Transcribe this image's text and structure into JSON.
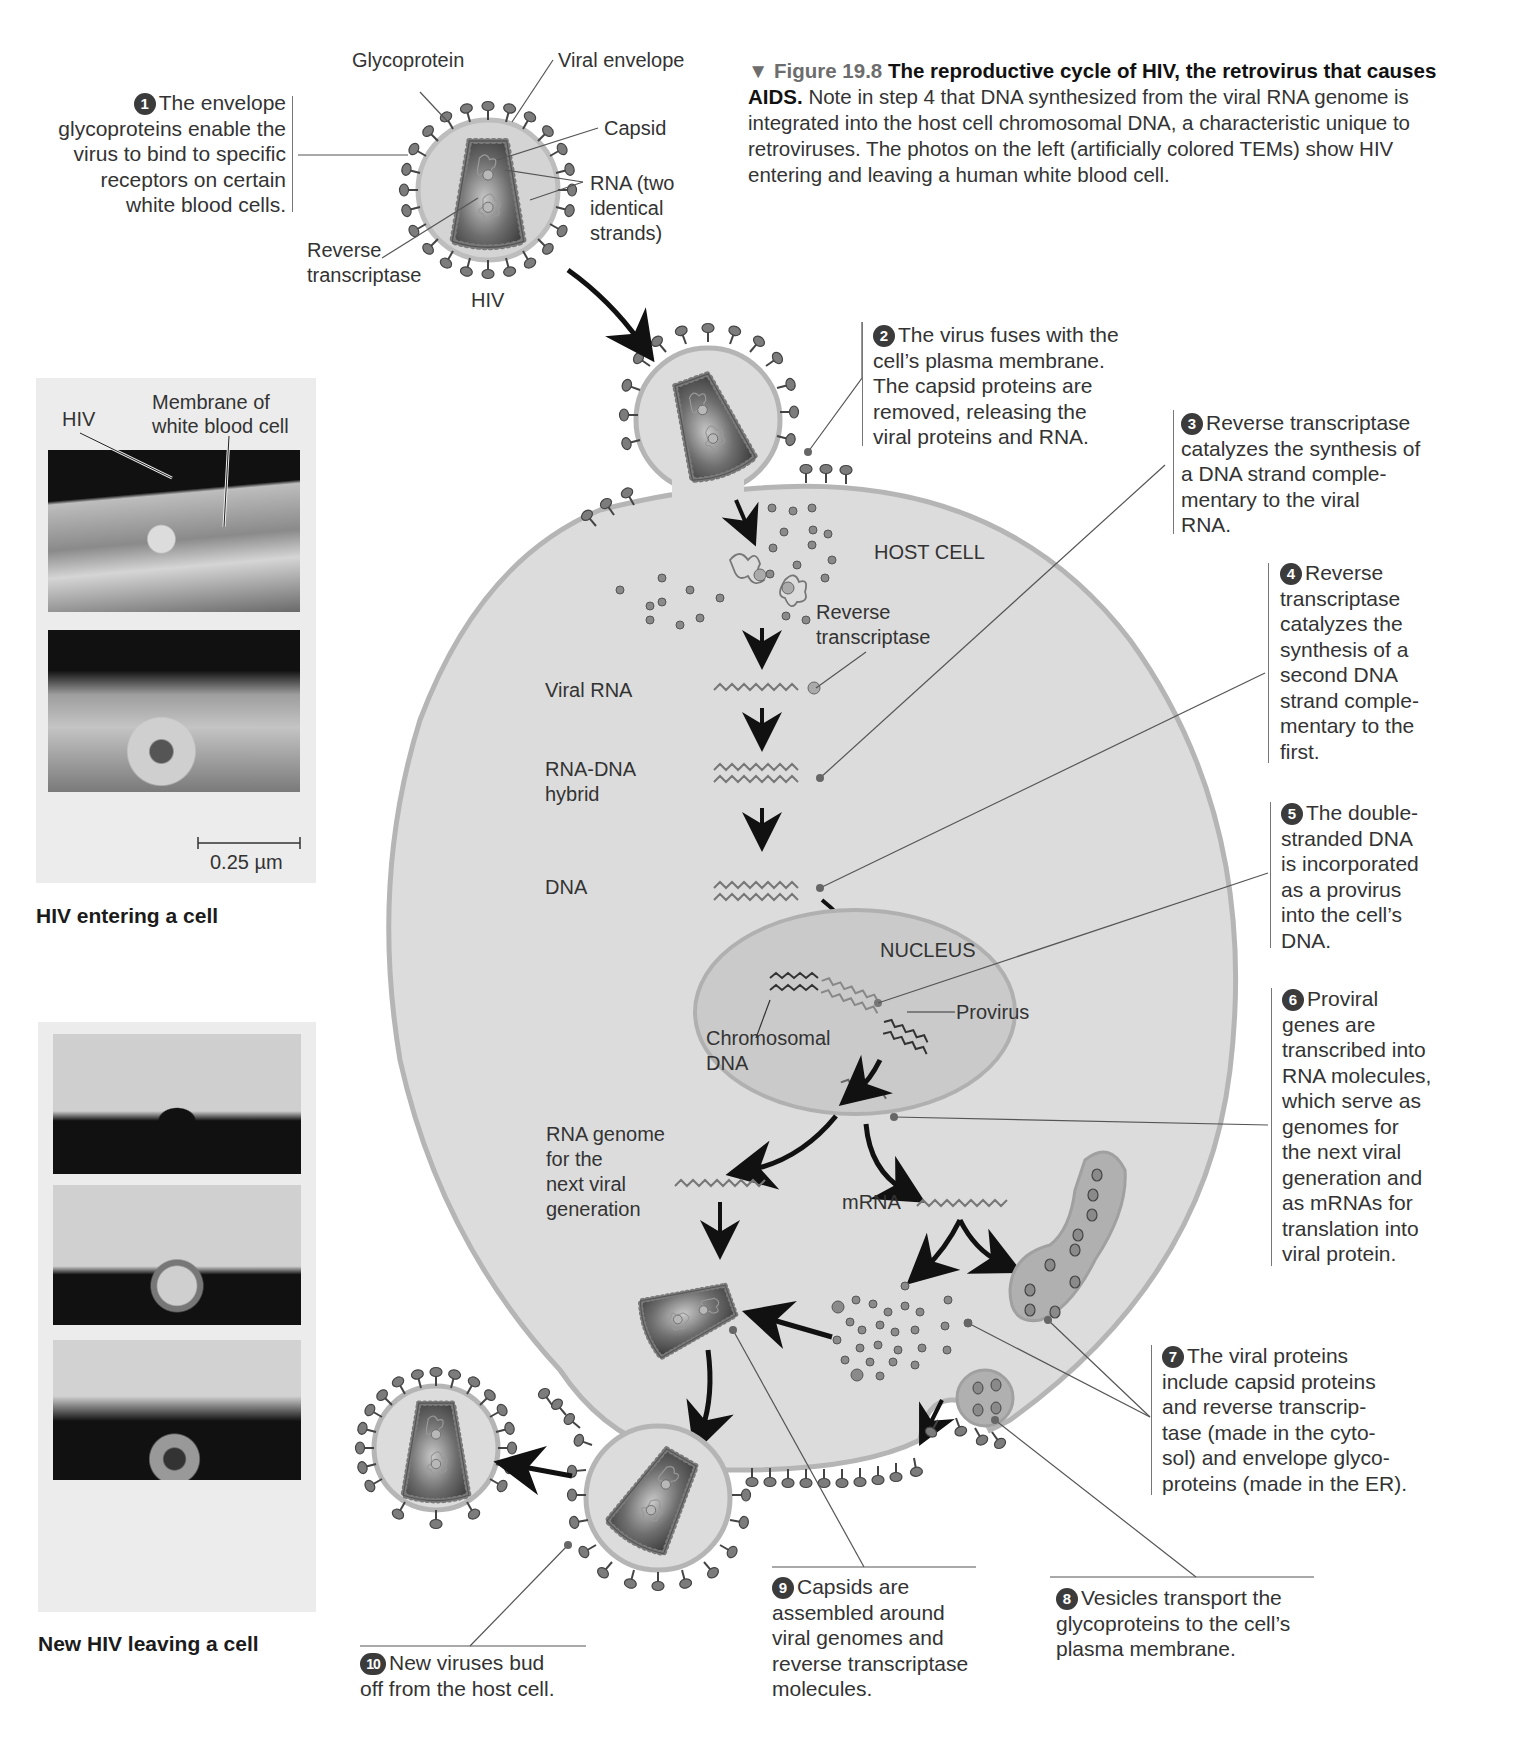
{
  "caption": {
    "marker": "▼",
    "figure_label": "Figure 19.8",
    "title": "The reproductive cycle of HIV, the retrovirus that causes AIDS.",
    "body": "Note in step 4 that DNA synthesized from the viral RNA genome is integrated into the host cell chromosomal DNA, a characteristic unique to retroviruses. The photos on the left (artificially colored TEMs) show HIV entering and leaving a human white blood cell."
  },
  "virion_labels": {
    "glycoprotein": "Glycoprotein",
    "viral_envelope": "Viral envelope",
    "capsid": "Capsid",
    "rna_line1": "RNA (two",
    "rna_line2": "identical",
    "rna_line3": "strands)",
    "rt_line1": "Reverse",
    "rt_line2": "transcriptase",
    "hiv": "HIV"
  },
  "cell_labels": {
    "host_cell": "HOST CELL",
    "rt_line1": "Reverse",
    "rt_line2": "transcriptase",
    "viral_rna": "Viral RNA",
    "rna_dna_line1": "RNA-DNA",
    "rna_dna_line2": "hybrid",
    "dna": "DNA",
    "nucleus": "NUCLEUS",
    "provirus": "Provirus",
    "chromosomal_line1": "Chromosomal",
    "chromosomal_line2": "DNA",
    "rna_genome_line1": "RNA genome",
    "rna_genome_line2": "for the",
    "rna_genome_line3": "next viral",
    "rna_genome_line4": "generation",
    "mrna": "mRNA"
  },
  "steps": [
    {
      "num": "1",
      "lines": [
        "The envelope",
        "glycoproteins enable the",
        "virus to bind to specific",
        "receptors on certain",
        "white blood cells."
      ]
    },
    {
      "num": "2",
      "lines": [
        "The virus fuses with the",
        "cell’s plasma membrane.",
        "The capsid proteins are",
        "removed, releasing the",
        "viral proteins and RNA."
      ]
    },
    {
      "num": "3",
      "lines": [
        "Reverse transcriptase",
        "catalyzes the synthesis of",
        "a DNA strand comple-",
        "mentary to the viral",
        "RNA."
      ]
    },
    {
      "num": "4",
      "lines": [
        "Reverse",
        "transcriptase",
        "catalyzes the",
        "synthesis of a",
        "second DNA",
        "strand comple-",
        "mentary to the",
        "first."
      ]
    },
    {
      "num": "5",
      "lines": [
        "The double-",
        "stranded DNA",
        "is incorporated",
        "as a provirus",
        "into the cell’s",
        "DNA."
      ]
    },
    {
      "num": "6",
      "lines": [
        "Proviral",
        "genes are",
        "transcribed into",
        "RNA molecules,",
        "which serve as",
        "genomes for",
        "the next viral",
        "generation and",
        "as mRNAs for",
        "translation into",
        "viral protein."
      ]
    },
    {
      "num": "7",
      "lines": [
        "The viral proteins",
        "include capsid proteins",
        "and reverse transcrip-",
        "tase (made in the cyto-",
        "sol) and envelope glyco-",
        "proteins (made in the ER)."
      ]
    },
    {
      "num": "8",
      "lines": [
        "Vesicles transport the",
        "glycoproteins to the cell’s",
        "plasma membrane."
      ]
    },
    {
      "num": "9",
      "lines": [
        "Capsids are",
        "assembled around",
        "viral genomes and",
        "reverse transcriptase",
        "molecules."
      ]
    },
    {
      "num": "10",
      "lines": [
        "New viruses bud",
        "off from the host cell."
      ]
    }
  ],
  "photos": {
    "entering": {
      "label_hiv": "HIV",
      "label_membrane_line1": "Membrane of",
      "label_membrane_line2": "white blood cell",
      "scale_bar": "0.25 µm",
      "title": "HIV entering a cell"
    },
    "leaving": {
      "title": "New HIV leaving a cell"
    }
  },
  "colors": {
    "cell_fill": "#dcdcdc",
    "cell_edge": "#b5b5b5",
    "nucleus_fill": "#cacaca",
    "capsid_dark": "#3e3e3e",
    "glycoprotein": "#7a7a7a",
    "text": "#333333",
    "figure_label": "#6d6d6d"
  }
}
